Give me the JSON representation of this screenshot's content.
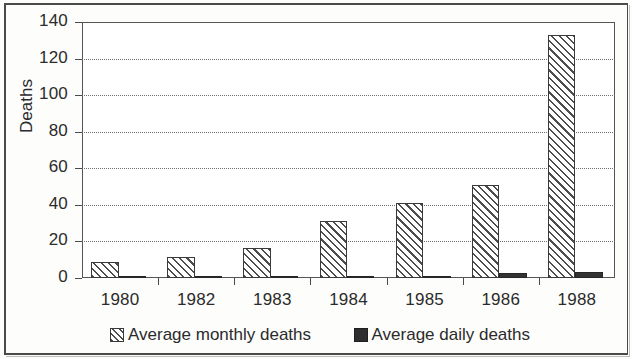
{
  "chart_data": {
    "type": "bar",
    "title": "",
    "xlabel": "",
    "ylabel": "Deaths",
    "ylim": [
      0,
      140
    ],
    "yticks": [
      0,
      20,
      40,
      60,
      80,
      100,
      120,
      140
    ],
    "ytick_labels": [
      "0",
      "20",
      "40",
      "60",
      "80",
      "100",
      "120",
      "140"
    ],
    "grid": true,
    "grid_axis": "y",
    "grid_style": "dotted",
    "legend_position": "bottom",
    "categories": [
      "1980",
      "1982",
      "1983",
      "1984",
      "1985",
      "1986",
      "1988"
    ],
    "series": [
      {
        "name": "Average monthly deaths",
        "fill": "diagonal-hatch",
        "values": [
          9,
          11.5,
          16.5,
          31,
          41,
          51,
          133
        ]
      },
      {
        "name": "Average daily deaths",
        "fill": "solid-black",
        "values": [
          0.3,
          0.4,
          0.5,
          1.0,
          1.3,
          3.0,
          3.2
        ]
      }
    ]
  },
  "colors": {
    "axis": "#4a4a4a",
    "grid": "#6e6e6e",
    "hatch": "#4d4d4d",
    "solid": "#333333",
    "text": "#2b2b2b",
    "background": "#ffffff"
  }
}
